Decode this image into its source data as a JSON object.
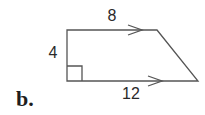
{
  "part_label": "b.",
  "figure": {
    "type": "right trapezoid",
    "top_side_label": "8",
    "bottom_side_label": "12",
    "height_label": "4",
    "parallel_marks": [
      "top",
      "bottom"
    ],
    "right_angle": "bottom-left"
  },
  "colors": {
    "line": "#555555",
    "text": "#2a2a2a"
  }
}
